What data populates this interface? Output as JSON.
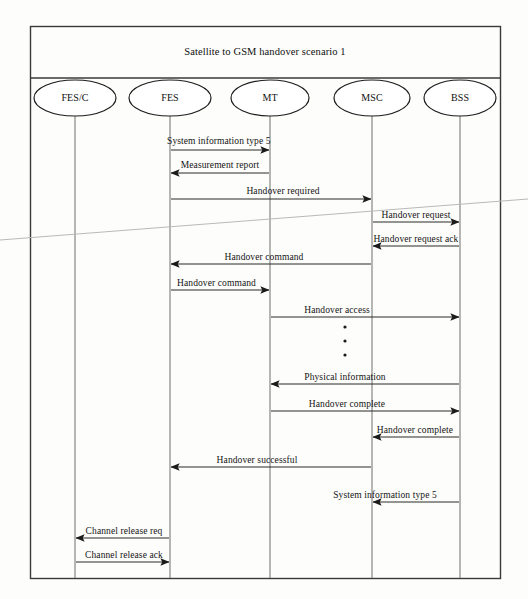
{
  "document": {
    "title": "Satellite to GSM  handover  scenario 1",
    "type": "sequence-diagram",
    "scan_artifact": "diagonal-scan-line"
  },
  "frame": {
    "x": 30,
    "y": 26,
    "width": 470,
    "height": 552,
    "title_divider_y": 78
  },
  "actors": [
    {
      "id": "fesc",
      "label": "FES/C",
      "x": 75,
      "ellipse_rx": 41,
      "ellipse_ry": 18,
      "ellipse_cy": 98,
      "lifeline_top": 116,
      "lifeline_bottom": 578
    },
    {
      "id": "fes",
      "label": "FES",
      "x": 170,
      "ellipse_rx": 41,
      "ellipse_ry": 18,
      "ellipse_cy": 98,
      "lifeline_top": 116,
      "lifeline_bottom": 578
    },
    {
      "id": "mt",
      "label": "MT",
      "x": 270,
      "ellipse_rx": 39,
      "ellipse_ry": 18,
      "ellipse_cy": 98,
      "lifeline_top": 116,
      "lifeline_bottom": 578
    },
    {
      "id": "msc",
      "label": "MSC",
      "x": 372,
      "ellipse_rx": 38,
      "ellipse_ry": 18,
      "ellipse_cy": 98,
      "lifeline_top": 116,
      "lifeline_bottom": 578
    },
    {
      "id": "bss",
      "label": "BSS",
      "x": 460,
      "ellipse_rx": 36,
      "ellipse_ry": 18,
      "ellipse_cy": 98,
      "lifeline_top": 116,
      "lifeline_bottom": 578
    }
  ],
  "messages": [
    {
      "n": 1,
      "label": "System information type 5",
      "from": "fes",
      "to": "mt",
      "y": 150,
      "dir": "right",
      "label_x": 167,
      "label_y": 136,
      "align": "left"
    },
    {
      "n": 2,
      "label": "Measurement report",
      "from": "mt",
      "to": "fes",
      "y": 173,
      "dir": "left",
      "label_x": 220,
      "label_y": 160,
      "align": "center"
    },
    {
      "n": 3,
      "label": "Handover required",
      "from": "fes",
      "to": "msc",
      "y": 199,
      "dir": "right",
      "label_x": 283,
      "label_y": 186,
      "align": "center"
    },
    {
      "n": 4,
      "label": "Handover request",
      "from": "msc",
      "to": "bss",
      "y": 222,
      "dir": "right",
      "label_x": 416,
      "label_y": 210,
      "align": "center"
    },
    {
      "n": 5,
      "label": "Handover request  ack",
      "from": "bss",
      "to": "msc",
      "y": 246,
      "dir": "left",
      "label_x": 416,
      "label_y": 234,
      "align": "center"
    },
    {
      "n": 6,
      "label": "Handover command",
      "from": "msc",
      "to": "fes",
      "y": 264,
      "dir": "left",
      "label_x": 264,
      "label_y": 252,
      "align": "center"
    },
    {
      "n": 7,
      "label": "Handover command",
      "from": "fes",
      "to": "mt",
      "y": 290,
      "dir": "right",
      "label_x": 177,
      "label_y": 278,
      "align": "left"
    },
    {
      "n": 8,
      "label": "Handover access",
      "from": "mt",
      "to": "bss",
      "y": 317,
      "dir": "right",
      "label_x": 337,
      "label_y": 305,
      "align": "center"
    },
    {
      "n": 9,
      "label": "Physical information",
      "from": "bss",
      "to": "mt",
      "y": 384,
      "dir": "left",
      "label_x": 345,
      "label_y": 372,
      "align": "center"
    },
    {
      "n": 10,
      "label": "Handover complete",
      "from": "mt",
      "to": "bss",
      "y": 411,
      "dir": "right",
      "label_x": 347,
      "label_y": 399,
      "align": "center"
    },
    {
      "n": 11,
      "label": "Handover complete",
      "from": "bss",
      "to": "msc",
      "y": 437,
      "dir": "left",
      "label_x": 415,
      "label_y": 425,
      "align": "center"
    },
    {
      "n": 12,
      "label": "Handover successful",
      "from": "msc",
      "to": "fes",
      "y": 467,
      "dir": "left",
      "label_x": 257,
      "label_y": 455,
      "align": "center"
    },
    {
      "n": 13,
      "label": "System information type 5",
      "from": "bss",
      "to": "msc",
      "y": 502,
      "dir": "left",
      "label_x": 385,
      "label_y": 490,
      "align": "center"
    },
    {
      "n": 14,
      "label": "Channel release req",
      "from": "fes",
      "to": "fesc",
      "y": 538,
      "dir": "left",
      "label_x": 124,
      "label_y": 526,
      "align": "center"
    },
    {
      "n": 15,
      "label": "Channel release ack",
      "from": "fesc",
      "to": "fes",
      "y": 562,
      "dir": "right",
      "label_x": 124,
      "label_y": 550,
      "align": "center"
    }
  ],
  "ellipsis_dots": {
    "x": 345,
    "ys": [
      327,
      341,
      355
    ],
    "radius": 1.6
  },
  "colors": {
    "ink": "#141414",
    "line": "#2b2b2b",
    "lifeline": "#6e6e6e",
    "frame": "#3a3a3a",
    "paper": "#fdfdfb",
    "artifact": "#b9b9b9"
  }
}
